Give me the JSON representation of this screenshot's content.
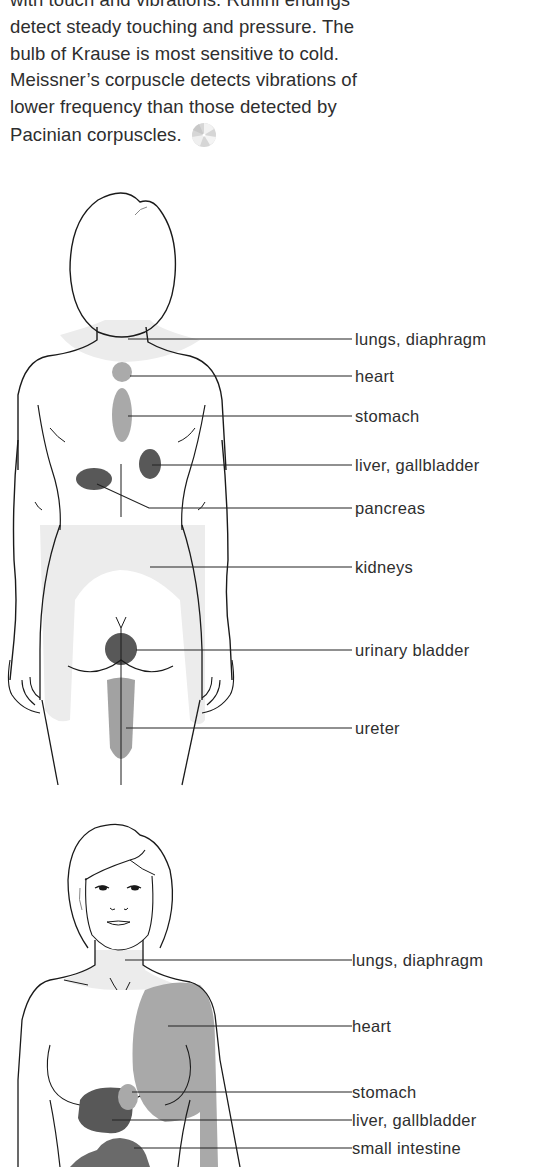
{
  "text": {
    "lines": [
      "with touch and vibrations. Ruffini endings",
      "detect steady touching and pressure. The",
      "bulb of Krause is most sensitive to cold.",
      "Meissner’s corpuscle detects vibrations of",
      "lower frequency than those detected by",
      "Pacinian corpuscles."
    ],
    "end_icon": "disc-icon"
  },
  "figures": [
    {
      "name": "back-view-male",
      "labels": [
        "lungs, diaphragm",
        "heart",
        "stomach",
        "liver, gallbladder",
        "pancreas",
        "kidneys",
        "urinary bladder",
        "ureter"
      ]
    },
    {
      "name": "front-view-female",
      "labels": [
        "lungs, diaphragm",
        "heart",
        "stomach",
        "liver, gallbladder",
        "small intestine"
      ]
    }
  ],
  "colors": {
    "outline": "#1a1a1a",
    "light_zone": "#ececec",
    "medium_zone": "#a9a9a9",
    "dark_zone": "#5a5a5a"
  }
}
